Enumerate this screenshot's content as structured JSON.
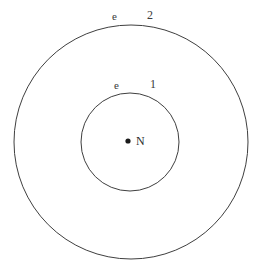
{
  "figure": {
    "type": "bohr-atom-orbit-diagram",
    "background_color": "#ffffff",
    "stroke_color": "#3f3f3f",
    "text_color": "#333333"
  },
  "nucleus": {
    "marker_name": "nucleus-dot",
    "label": "N",
    "center_x": 128,
    "center_y": 141,
    "dot_radius": 2.6,
    "dot_color": "#1a1a1a"
  },
  "shells": [
    {
      "index": 1,
      "electron_label": "e",
      "shell_number": "1",
      "center_x": 130,
      "center_y": 142,
      "radius": 49,
      "stroke_width": 1
    },
    {
      "index": 2,
      "electron_label": "e",
      "shell_number": "2",
      "center_x": 131,
      "center_y": 142,
      "radius": 117,
      "stroke_width": 1
    }
  ],
  "chart_data": {
    "type": "scatter",
    "title": "",
    "xlabel": "",
    "ylabel": "",
    "annotations": [
      "e",
      "2",
      "e",
      "1",
      "N"
    ],
    "series": [
      {
        "name": "nucleus",
        "x": [
          128
        ],
        "y": [
          141
        ]
      },
      {
        "name": "shell-1",
        "center": [
          130,
          142
        ],
        "radius": 49
      },
      {
        "name": "shell-2",
        "center": [
          131,
          142
        ],
        "radius": 117
      }
    ]
  }
}
